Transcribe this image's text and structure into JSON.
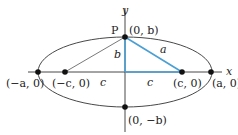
{
  "diagram": {
    "type": "ellipse-foci-geometry",
    "axes": {
      "x_label": "x",
      "y_label": "y"
    },
    "points": [
      {
        "id": "left-vertex",
        "label": "(−a, 0)"
      },
      {
        "id": "left-focus",
        "label": "(−c, 0)"
      },
      {
        "id": "right-focus",
        "label": "(c, 0)"
      },
      {
        "id": "right-vertex",
        "label": "(a, 0)"
      },
      {
        "id": "top-covertex",
        "label": "(0, b)",
        "name": "P"
      },
      {
        "id": "bottom-covertex",
        "label": "(0, −b)"
      }
    ],
    "segments": {
      "hypotenuse": "a",
      "vertical_leg": "b",
      "left_c": "c",
      "right_c": "c"
    },
    "colors": {
      "highlight": "#4a9fd4",
      "line": "#333333",
      "point": "#111111"
    }
  }
}
